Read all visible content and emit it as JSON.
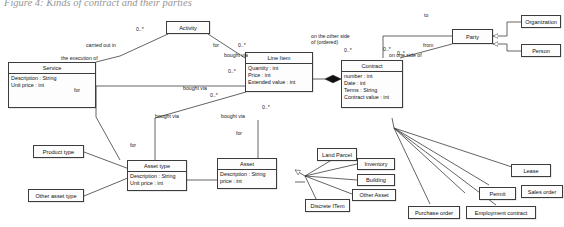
{
  "figure": {
    "caption": "Figure 4: Kinds of contract and their parties"
  },
  "classes": {
    "activity": {
      "name": "Activity",
      "attrs": []
    },
    "service": {
      "name": "Service",
      "attrs": [
        "Description : String",
        "Unit price : int"
      ]
    },
    "line_item": {
      "name": "Line Item",
      "attrs": [
        "Quantity : int",
        "Price : int",
        "Extended value : int"
      ]
    },
    "contract": {
      "name": "Contract",
      "attrs": [
        "number : int",
        "Date : int",
        "Terms : String",
        "Contract value : int"
      ]
    },
    "party": {
      "name": "Party",
      "attrs": []
    },
    "organization": {
      "name": "Organization",
      "attrs": []
    },
    "person": {
      "name": "Person",
      "attrs": []
    },
    "product_type": {
      "name": "Product type",
      "attrs": []
    },
    "other_asset_type": {
      "name": "Other asset type",
      "attrs": []
    },
    "asset_type": {
      "name": "Asset type",
      "attrs": [
        "Description : String",
        "Unit price : int"
      ]
    },
    "asset": {
      "name": "Asset",
      "attrs": [
        "Description : String",
        "price : int"
      ]
    },
    "land_parcel": {
      "name": "Land Parcel",
      "attrs": []
    },
    "inventory": {
      "name": "Inventory",
      "attrs": []
    },
    "building": {
      "name": "Building",
      "attrs": []
    },
    "other_asset": {
      "name": "Other Asset",
      "attrs": []
    },
    "discrete_item": {
      "name": "Discrete ITem",
      "attrs": []
    },
    "lease": {
      "name": "Lease",
      "attrs": []
    },
    "permit": {
      "name": "Permit",
      "attrs": []
    },
    "sales_order": {
      "name": "Sales order",
      "attrs": []
    },
    "purchase_order": {
      "name": "Purchase order",
      "attrs": []
    },
    "employment_contract": {
      "name": "Employment contract",
      "attrs": []
    }
  },
  "labels": {
    "carried_out_in": "carried out in",
    "the_execution_of": "the execution of",
    "for_activity_lineitem": "for",
    "bought_via_activity": "bought via",
    "for_service_asset": "for",
    "bought_via_service": "bought via",
    "bought_via_assettype": "bought via",
    "bought_via_asset": "bought via",
    "for_assettype": "for",
    "for_asset": "for",
    "on_the_other_side_of": "on the other side of (ordered)",
    "on_one_side_of": "on one side of",
    "to": "to",
    "from": "from"
  },
  "multiplicities": {
    "activity_left": "0..*",
    "activity_right": "0..*",
    "lineitem_left": "0..*",
    "lineitem_bottom_left": "0..*",
    "lineitem_bottom_right": "0..*",
    "contract_other_side": "0..*",
    "contract_one_side": "0..*",
    "contract_from": "0..*"
  },
  "colors": {
    "line": "#3c3c3c",
    "box_fill": "#fdfdfd",
    "text": "#111111",
    "page_bg": "#ffffff"
  }
}
